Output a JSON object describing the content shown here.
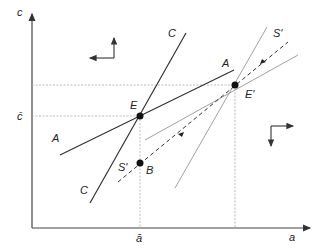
{
  "axes": {
    "y_label": "c",
    "x_label": "a",
    "y_tick": "c̄",
    "x_tick": "ā"
  },
  "curves": [
    {
      "name": "C",
      "style": "solid",
      "labels": [
        "C",
        "C"
      ]
    },
    {
      "name": "A",
      "style": "solid",
      "labels": [
        "A",
        "A"
      ]
    },
    {
      "name": "S'",
      "style": "dashed",
      "labels": [
        "S'",
        "S'"
      ]
    }
  ],
  "points": [
    {
      "name": "E",
      "label": "E"
    },
    {
      "name": "E'",
      "label": "E'"
    },
    {
      "name": "B",
      "label": "B"
    }
  ],
  "colors": {
    "line": "#333333",
    "guide": "#999999",
    "point": "#111111"
  }
}
